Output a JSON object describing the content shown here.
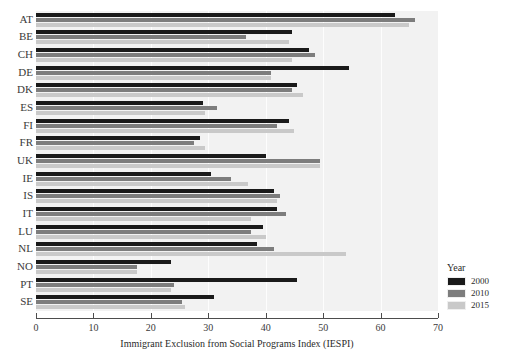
{
  "chart_data": {
    "type": "bar",
    "orientation": "horizontal",
    "title": "",
    "xlabel": "Immigrant Exclusion from Social Programs Index (IESPI)",
    "ylabel": "",
    "xlim": [
      0,
      70
    ],
    "xticks": [
      0,
      10,
      20,
      30,
      40,
      50,
      60,
      70
    ],
    "grid": true,
    "legend": {
      "title": "Year",
      "position": "right-bottom",
      "entries": [
        {
          "label": "2000",
          "color": "#1a1a1a"
        },
        {
          "label": "2010",
          "color": "#7d7d7d"
        },
        {
          "label": "2015",
          "color": "#c9c9c9"
        }
      ]
    },
    "categories": [
      "AT",
      "BE",
      "CH",
      "DE",
      "DK",
      "ES",
      "FI",
      "FR",
      "UK",
      "IE",
      "IS",
      "IT",
      "LU",
      "NL",
      "NO",
      "PT",
      "SE"
    ],
    "series": [
      {
        "name": "2000",
        "color": "#1a1a1a",
        "values": [
          62.5,
          44.5,
          47.5,
          54.5,
          45.5,
          29.0,
          44.0,
          28.5,
          40.0,
          30.5,
          41.5,
          42.0,
          39.5,
          38.5,
          23.5,
          45.5,
          31.0
        ]
      },
      {
        "name": "2010",
        "color": "#7d7d7d",
        "values": [
          66.0,
          36.5,
          48.5,
          41.0,
          44.5,
          31.5,
          42.0,
          27.5,
          49.5,
          34.0,
          42.5,
          43.5,
          37.5,
          41.5,
          17.5,
          24.0,
          25.5
        ]
      },
      {
        "name": "2015",
        "color": "#c9c9c9",
        "values": [
          65.0,
          44.0,
          44.5,
          41.0,
          46.5,
          29.5,
          45.0,
          29.5,
          49.5,
          37.0,
          42.0,
          37.5,
          40.0,
          54.0,
          17.5,
          23.5,
          26.0
        ]
      }
    ]
  }
}
